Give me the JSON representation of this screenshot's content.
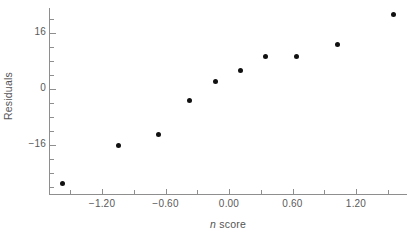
{
  "chart_data": {
    "type": "scatter",
    "title": "",
    "xlabel": "n score",
    "xlabel_parts": {
      "variable": "n",
      "rest": " score"
    },
    "ylabel": "Residuals",
    "xlim": [
      -1.8,
      1.8
    ],
    "ylim": [
      -31.0,
      24.5
    ],
    "grid": false,
    "legend": null,
    "xticks": [
      -1.2,
      -0.6,
      0.0,
      0.6,
      1.2
    ],
    "xticklabels": [
      "−1.20",
      "−0.60",
      "0.00",
      "0.60",
      "1.20"
    ],
    "yticks": [
      16,
      0,
      -16
    ],
    "yticklabels": [
      "16",
      "0",
      "−16"
    ],
    "x_minor_interval": 0.3,
    "y_minor_interval": 4,
    "point_color": "#111111",
    "axis_color": "#8e8e8e",
    "points": [
      {
        "x": -1.57,
        "y": -27.0
      },
      {
        "x": -1.04,
        "y": -16.0
      },
      {
        "x": -0.67,
        "y": -13.0
      },
      {
        "x": -0.37,
        "y": -3.4
      },
      {
        "x": -0.13,
        "y": 2.3
      },
      {
        "x": 0.11,
        "y": 5.4
      },
      {
        "x": 0.34,
        "y": 9.4
      },
      {
        "x": 0.64,
        "y": 9.4
      },
      {
        "x": 1.02,
        "y": 12.6
      },
      {
        "x": 1.55,
        "y": 21.4
      }
    ]
  }
}
